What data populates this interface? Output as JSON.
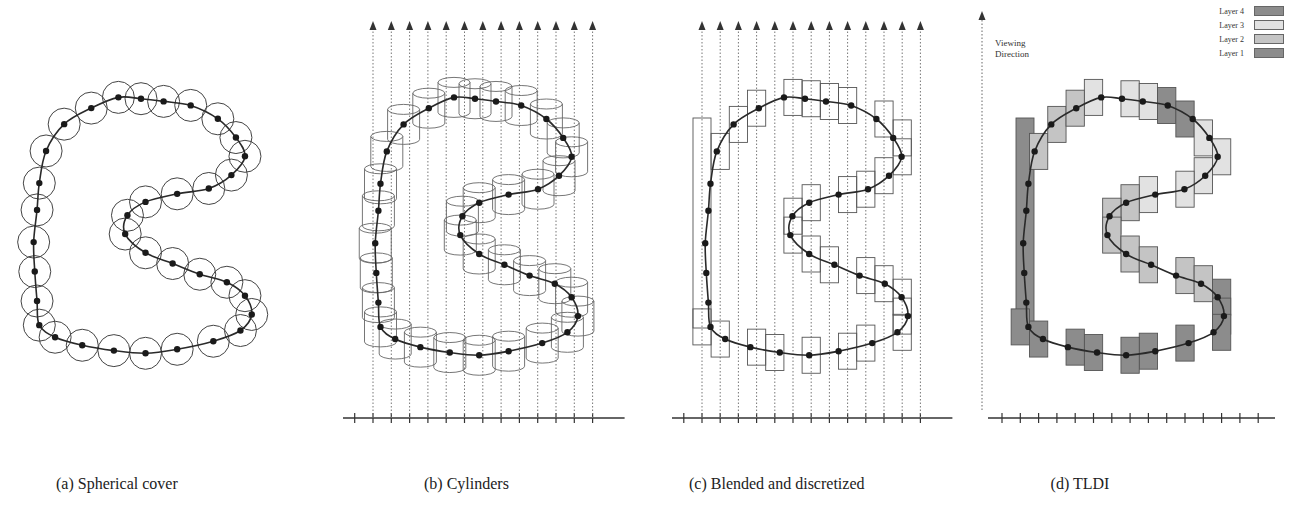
{
  "figure": {
    "panels": [
      {
        "id": "a",
        "caption": "(a) Spherical cover",
        "style": "spheres"
      },
      {
        "id": "b",
        "caption": "(b) Cylinders",
        "style": "cylinders"
      },
      {
        "id": "c",
        "caption": "(c) Blended and discretized",
        "style": "boxes"
      },
      {
        "id": "d",
        "caption": "(d) TLDI",
        "style": "layers"
      }
    ],
    "viewing_direction_label": [
      "Viewing",
      "Direction"
    ],
    "legend": [
      {
        "label": "Layer 4",
        "color": "#8c8c8c"
      },
      {
        "label": "Layer 3",
        "color": "#e2e2e2"
      },
      {
        "label": "Layer 2",
        "color": "#c4c4c4"
      },
      {
        "label": "Layer 1",
        "color": "#8c8c8c"
      }
    ],
    "ray_count": 13,
    "curve_points": [
      [
        0.4,
        0.02
      ],
      [
        0.5,
        0.025
      ],
      [
        0.6,
        0.035
      ],
      [
        0.72,
        0.05
      ],
      [
        0.84,
        0.1
      ],
      [
        0.92,
        0.17
      ],
      [
        0.96,
        0.24
      ],
      [
        0.9,
        0.31
      ],
      [
        0.8,
        0.36
      ],
      [
        0.66,
        0.38
      ],
      [
        0.52,
        0.41
      ],
      [
        0.44,
        0.46
      ],
      [
        0.43,
        0.53
      ],
      [
        0.52,
        0.6
      ],
      [
        0.64,
        0.64
      ],
      [
        0.76,
        0.68
      ],
      [
        0.88,
        0.71
      ],
      [
        0.96,
        0.76
      ],
      [
        0.99,
        0.83
      ],
      [
        0.94,
        0.89
      ],
      [
        0.82,
        0.93
      ],
      [
        0.66,
        0.96
      ],
      [
        0.52,
        0.975
      ],
      [
        0.38,
        0.965
      ],
      [
        0.24,
        0.945
      ],
      [
        0.12,
        0.915
      ],
      [
        0.05,
        0.87
      ],
      [
        0.04,
        0.78
      ],
      [
        0.03,
        0.67
      ],
      [
        0.025,
        0.56
      ],
      [
        0.04,
        0.44
      ],
      [
        0.05,
        0.34
      ],
      [
        0.08,
        0.22
      ],
      [
        0.16,
        0.12
      ],
      [
        0.28,
        0.06
      ]
    ]
  }
}
